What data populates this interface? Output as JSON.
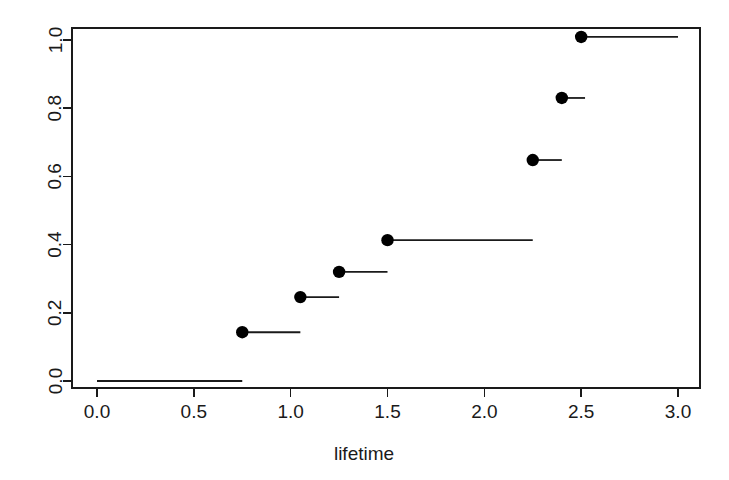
{
  "chart_data": {
    "type": "line",
    "subtype": "step-ecdf",
    "title": "",
    "xlabel": "lifetime",
    "ylabel": "",
    "xlim": [
      0.0,
      3.0
    ],
    "ylim": [
      0.0,
      1.0
    ],
    "grid": false,
    "legend": null,
    "x_ticks": [
      0.0,
      0.5,
      1.0,
      1.5,
      2.0,
      2.5,
      3.0
    ],
    "x_tick_labels": [
      "0.0",
      "0.5",
      "1.0",
      "1.5",
      "2.0",
      "2.5",
      "3.0"
    ],
    "y_ticks": [
      0.0,
      0.2,
      0.4,
      0.6,
      0.8,
      1.0
    ],
    "y_tick_labels": [
      "0.0",
      "0.2",
      "0.4",
      "0.6",
      "0.8",
      "1.0"
    ],
    "y_tick_labels_rotated": true,
    "marker": "filled-circle",
    "marker_color": "#000000",
    "line_color": "#1a1a1a",
    "steps": [
      {
        "x_start": 0.0,
        "x_end": 0.75,
        "y": 0.0,
        "dot": false
      },
      {
        "x_start": 0.75,
        "x_end": 1.05,
        "y": 0.143,
        "dot": true
      },
      {
        "x_start": 1.05,
        "x_end": 1.25,
        "y": 0.246,
        "dot": true
      },
      {
        "x_start": 1.25,
        "x_end": 1.5,
        "y": 0.32,
        "dot": true
      },
      {
        "x_start": 1.5,
        "x_end": 2.25,
        "y": 0.413,
        "dot": true
      },
      {
        "x_start": 2.25,
        "x_end": 2.4,
        "y": 0.648,
        "dot": true
      },
      {
        "x_start": 2.4,
        "x_end": 2.52,
        "y": 0.83,
        "dot": true
      },
      {
        "x_start": 2.5,
        "x_end": 3.0,
        "y": 1.009,
        "dot": true
      }
    ],
    "jump_points": [
      {
        "x": 0.75,
        "y": 0.143
      },
      {
        "x": 1.05,
        "y": 0.246
      },
      {
        "x": 1.25,
        "y": 0.32
      },
      {
        "x": 1.5,
        "y": 0.413
      },
      {
        "x": 2.25,
        "y": 0.648
      },
      {
        "x": 2.4,
        "y": 0.83
      },
      {
        "x": 2.5,
        "y": 1.009
      }
    ]
  },
  "plot_box": {
    "left_px": 72,
    "right_px": 700,
    "top_px": 28,
    "bottom_px": 388
  },
  "scale": {
    "x_zero_px": 97,
    "x_unit_px": 193.67,
    "y_zero_px": 381,
    "y_unit_px": 341
  }
}
